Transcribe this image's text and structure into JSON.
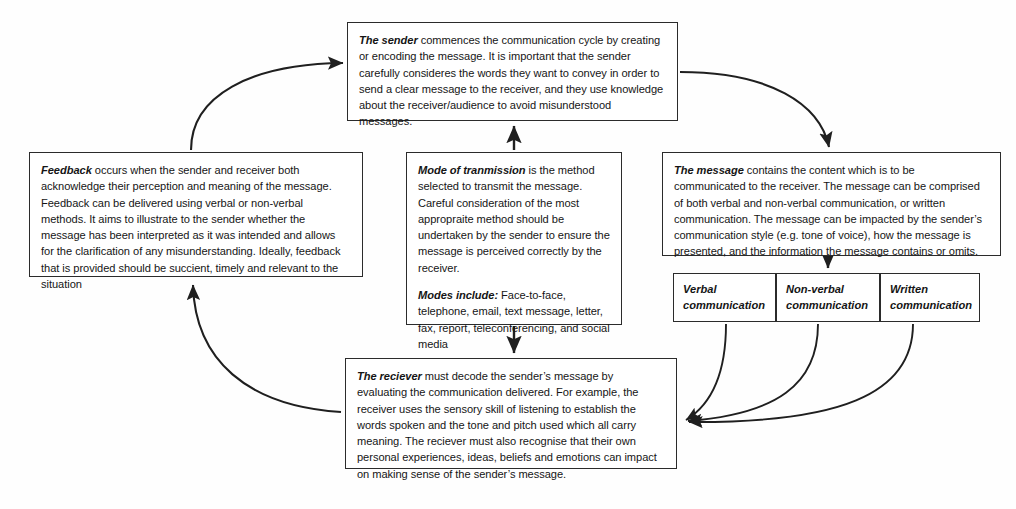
{
  "diagram": {
    "title": "The communication cycle",
    "stroke_color": "#2b2b2b",
    "background_color": "#ffffff"
  },
  "nodes": {
    "sender": {
      "lead": "The sender",
      "body": " commences the communication cycle by creating or encoding the message. It is important that the sender carefully consideres the words they want to convey in order to send a clear message to the receiver, and they use knowledge about the receiver/audience to avoid misunderstood messages."
    },
    "feedback": {
      "lead": "Feedback",
      "body": " occurs when the sender and receiver both acknowledge their perception and meaning of the message. Feedback can be delivered using verbal or non-verbal methods. It aims to illustrate to the sender whether the message has been interpreted as it was intended and allows for the clarification of any misunderstanding. Ideally, feedback that is provided should be succient, timely and relevant to the situation"
    },
    "mode": {
      "lead": "Mode of tranmission",
      "body": " is the method selected to transmit the message. Careful consideration of the most appropraite method should be undertaken by the sender to ensure the message is perceived correctly by the receiver.",
      "modes_lead": "Modes include:",
      "modes_body": " Face-to-face, telephone, email, text message, letter, fax, report, teleconferencing, and social media"
    },
    "message": {
      "lead": "The message",
      "body": " contains the content which is to be communicated to the receiver. The message can be comprised of both verbal and non-verbal communication, or written communication. The message can be impacted by the sender’s communication style (e.g. tone of voice), how the message is presented, and the information the message contains or omits."
    },
    "receiver": {
      "lead": "The reciever",
      "body": " must decode the sender’s message by evaluating the communication delivered. For example, the receiver uses the sensory skill of listening to establish the words spoken and the tone and pitch used which all carry meaning. The reciever must also recognise that their own personal experiences, ideas, beliefs and emotions can impact on making sense of the sender’s message."
    }
  },
  "subnodes": {
    "verbal": {
      "line1": "Verbal",
      "line2": "communication"
    },
    "nonverbal": {
      "line1": "Non-verbal",
      "line2": "communication"
    },
    "written": {
      "line1": "Written",
      "line2": "communication"
    }
  },
  "connectors": [
    {
      "name": "feedback-to-sender",
      "from": "feedback",
      "to": "sender",
      "style": "curve"
    },
    {
      "name": "sender-to-message",
      "from": "sender",
      "to": "message",
      "style": "curve"
    },
    {
      "name": "mode-to-sender",
      "from": "mode",
      "to": "sender",
      "style": "straight"
    },
    {
      "name": "mode-to-receiver",
      "from": "mode",
      "to": "receiver",
      "style": "straight"
    },
    {
      "name": "message-to-verbal-group",
      "from": "message",
      "to": "verbal",
      "style": "straight"
    },
    {
      "name": "verbal-to-receiver",
      "from": "verbal",
      "to": "receiver",
      "style": "curve"
    },
    {
      "name": "nonverbal-to-receiver",
      "from": "nonverbal",
      "to": "receiver",
      "style": "curve"
    },
    {
      "name": "written-to-receiver",
      "from": "written",
      "to": "receiver",
      "style": "curve"
    },
    {
      "name": "receiver-to-feedback",
      "from": "receiver",
      "to": "feedback",
      "style": "curve"
    }
  ]
}
